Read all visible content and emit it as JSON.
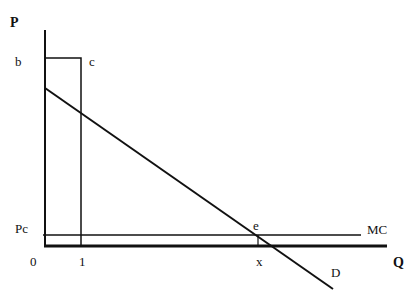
{
  "diagram": {
    "type": "economics-monopoly-price-diagram",
    "axes": {
      "y_label": "P",
      "x_label": "Q",
      "origin_label": "0"
    },
    "labels": {
      "b": "b",
      "c": "c",
      "pc": "Pc",
      "one": "1",
      "e": "e",
      "x": "x",
      "mc": "MC",
      "d": "D"
    },
    "curves": [
      {
        "name": "Demand",
        "label": "D",
        "from": [
          45,
          88
        ],
        "to": [
          333,
          289
        ]
      },
      {
        "name": "Marginal cost",
        "label": "MC",
        "from": [
          43,
          235
        ],
        "to": [
          361,
          235
        ]
      },
      {
        "name": "Price box",
        "points": [
          [
            45,
            58
          ],
          [
            81,
            58
          ],
          [
            81,
            246
          ]
        ]
      },
      {
        "name": "Quantity x drop",
        "from": [
          258,
          235
        ],
        "to": [
          258,
          246
        ]
      }
    ],
    "colors": {
      "line": "#111111",
      "background": "#ffffff"
    }
  }
}
